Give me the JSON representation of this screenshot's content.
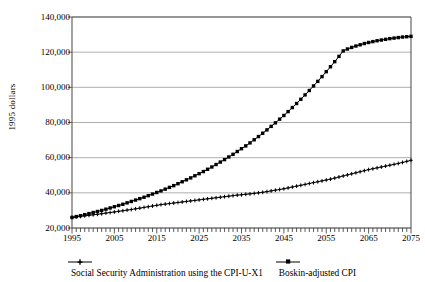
{
  "chart_data": {
    "type": "line",
    "title": "",
    "subtitle": "",
    "xlabel": "",
    "ylabel": "1995 dollars",
    "xlim": [
      1995,
      2075
    ],
    "ylim": [
      20000,
      140000
    ],
    "grid": "horizontal",
    "legend_position": "bottom",
    "y_ticks": [
      20000,
      40000,
      60000,
      80000,
      100000,
      120000,
      140000
    ],
    "y_tick_labels": [
      "20,000",
      "40,000",
      "60,000",
      "80,000",
      "100,000",
      "120,000",
      "140,000"
    ],
    "x_ticks": [
      1995,
      2005,
      2015,
      2025,
      2035,
      2045,
      2055,
      2065,
      2075
    ],
    "x_tick_labels": [
      "1995",
      "2005",
      "2015",
      "2025",
      "2035",
      "2045",
      "2055",
      "2065",
      "2075"
    ],
    "x_minor_tick_interval": 1,
    "x": [
      1995,
      1996,
      1997,
      1998,
      1999,
      2000,
      2001,
      2002,
      2003,
      2004,
      2005,
      2006,
      2007,
      2008,
      2009,
      2010,
      2011,
      2012,
      2013,
      2014,
      2015,
      2016,
      2017,
      2018,
      2019,
      2020,
      2021,
      2022,
      2023,
      2024,
      2025,
      2026,
      2027,
      2028,
      2029,
      2030,
      2031,
      2032,
      2033,
      2034,
      2035,
      2036,
      2037,
      2038,
      2039,
      2040,
      2041,
      2042,
      2043,
      2044,
      2045,
      2046,
      2047,
      2048,
      2049,
      2050,
      2051,
      2052,
      2053,
      2054,
      2055,
      2056,
      2057,
      2058,
      2059,
      2060,
      2061,
      2062,
      2063,
      2064,
      2065,
      2066,
      2067,
      2068,
      2069,
      2070,
      2071,
      2072,
      2073,
      2074,
      2075
    ],
    "series": [
      {
        "name": "Social Security Administration using the CPI-U-X1",
        "marker": "cross",
        "color": "#000000",
        "values": [
          26000,
          26300,
          26600,
          26900,
          27200,
          27500,
          27800,
          28100,
          28500,
          28800,
          29100,
          29500,
          29800,
          30200,
          30500,
          30900,
          31300,
          31700,
          32100,
          32500,
          32900,
          33300,
          33600,
          33900,
          34200,
          34500,
          34800,
          35100,
          35400,
          35700,
          36000,
          36300,
          36600,
          36900,
          37200,
          37500,
          37800,
          38100,
          38400,
          38700,
          38900,
          39200,
          39400,
          39700,
          40000,
          40300,
          40700,
          41100,
          41500,
          41900,
          42300,
          42800,
          43300,
          43800,
          44300,
          44800,
          45300,
          45800,
          46300,
          46800,
          47300,
          47800,
          48400,
          49000,
          49600,
          50200,
          50800,
          51400,
          52000,
          52600,
          53200,
          53700,
          54200,
          54700,
          55200,
          55700,
          56200,
          56700,
          57300,
          57900,
          58500
        ]
      },
      {
        "name": "Boskin-adjusted CPI",
        "marker": "square",
        "color": "#000000",
        "values": [
          26000,
          26500,
          27000,
          27600,
          28200,
          28800,
          29400,
          30000,
          30700,
          31400,
          32100,
          32800,
          33500,
          34300,
          35100,
          35900,
          36700,
          37500,
          38400,
          39300,
          40200,
          41100,
          42100,
          43100,
          44100,
          45200,
          46300,
          47400,
          48500,
          49700,
          50900,
          52100,
          53400,
          54700,
          56100,
          57500,
          58900,
          60400,
          61900,
          63500,
          65100,
          66700,
          68400,
          70200,
          72000,
          73900,
          75800,
          77800,
          79800,
          81900,
          84000,
          86200,
          88500,
          90800,
          93200,
          95700,
          98200,
          100800,
          103400,
          106100,
          108900,
          111700,
          114600,
          117600,
          120700,
          121800,
          122700,
          123500,
          124200,
          124900,
          125500,
          126000,
          126500,
          126900,
          127300,
          127700,
          128000,
          128300,
          128600,
          128800,
          129000
        ]
      }
    ]
  },
  "axes": {
    "ylabel": "1995 dollars"
  },
  "legend": {
    "items": [
      {
        "label": "Social Security Administration using the CPI-U-X1",
        "marker": "cross"
      },
      {
        "label": "Boskin-adjusted CPI",
        "marker": "square"
      }
    ]
  }
}
